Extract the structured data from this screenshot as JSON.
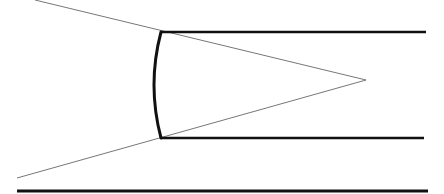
{
  "diagram": {
    "width": 444,
    "height": 194,
    "background": "#ffffff",
    "stroke_color": "#111111",
    "thin_stroke_color": "#777777",
    "elements": {
      "top_edge": {
        "x1": 161,
        "y1": 32,
        "x2": 426,
        "y2": 32,
        "width": 2.6
      },
      "bottom_edge": {
        "x1": 161,
        "y1": 138,
        "x2": 424,
        "y2": 138,
        "width": 2.6
      },
      "baseline": {
        "x1": 17,
        "y1": 191,
        "x2": 428,
        "y2": 191,
        "width": 3
      },
      "upper_ray": {
        "x1": 35,
        "y1": 0,
        "x2": 366,
        "y2": 80,
        "width": 1
      },
      "lower_ray": {
        "x1": 17,
        "y1": 178,
        "x2": 366,
        "y2": 80,
        "width": 1
      },
      "curved_surface": {
        "d": "M161,32 Q147,85 161,138",
        "width": 3
      },
      "apex": {
        "x": 366,
        "y": 80
      }
    }
  }
}
